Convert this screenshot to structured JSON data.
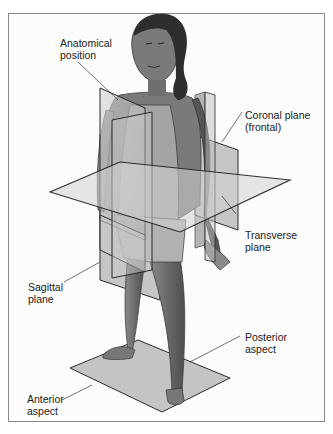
{
  "figure": {
    "labels": {
      "anatomical_position": "Anatomical\nposition",
      "coronal_plane": "Coronal plane\n(frontal)",
      "transverse_plane": "Transverse\nplane",
      "sagittal_plane": "Sagittal\nplane",
      "posterior_aspect": "Posterior\naspect",
      "anterior_aspect": "Anterior\naspect"
    },
    "colors": {
      "background": "#fcfcfc",
      "border": "#8a8a8a",
      "plane_fill": "#bdbdbd",
      "plane_edge": "#2a2a2a",
      "skin": "#6e6e6e",
      "hair": "#2e2e2e",
      "clothing": "#a8a8a8",
      "label_text": "#222222"
    }
  }
}
